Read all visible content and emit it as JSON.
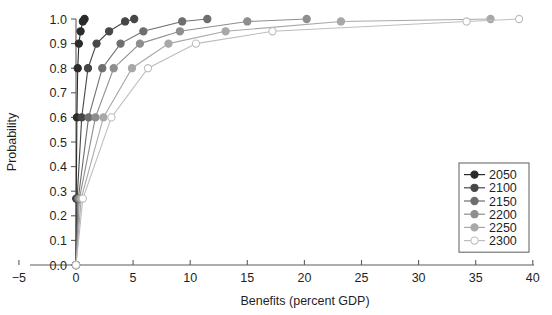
{
  "chart_data": {
    "type": "line",
    "title": "",
    "xlabel": "Benefits (percent GDP)",
    "ylabel": "Probability",
    "xlim": [
      -5,
      40
    ],
    "ylim": [
      0.0,
      1.0
    ],
    "xticks": [
      "-5",
      "0",
      "5",
      "10",
      "15",
      "20",
      "25",
      "30",
      "35",
      "40"
    ],
    "xtick_values": [
      -5,
      0,
      5,
      10,
      15,
      20,
      25,
      30,
      35,
      40
    ],
    "yticks": [
      "0.0",
      "0.1",
      "0.2",
      "0.3",
      "0.4",
      "0.5",
      "0.6",
      "0.7",
      "0.8",
      "0.9",
      "1.0"
    ],
    "ytick_values": [
      0.0,
      0.1,
      0.2,
      0.3,
      0.4,
      0.5,
      0.6,
      0.7,
      0.8,
      0.9,
      1.0
    ],
    "grid": false,
    "legend_position": "right-lower",
    "marker": "circle",
    "probability_levels": [
      0.0,
      0.27,
      0.6,
      0.8,
      0.9,
      0.95,
      0.99,
      1.0
    ],
    "series": [
      {
        "name": "2050",
        "color": "#2b2b2b",
        "marker_fill": "#2b2b2b",
        "x": [
          0.0,
          0.02,
          0.08,
          0.15,
          0.25,
          0.4,
          0.6,
          0.75
        ],
        "y": [
          0.0,
          0.27,
          0.6,
          0.8,
          0.9,
          0.95,
          0.99,
          1.0
        ]
      },
      {
        "name": "2100",
        "color": "#474747",
        "marker_fill": "#474747",
        "x": [
          0.0,
          0.1,
          0.5,
          1.05,
          1.8,
          2.9,
          4.3,
          5.1
        ],
        "y": [
          0.0,
          0.27,
          0.6,
          0.8,
          0.9,
          0.95,
          0.99,
          1.0
        ]
      },
      {
        "name": "2150",
        "color": "#6e6e6e",
        "marker_fill": "#6e6e6e",
        "x": [
          0.0,
          0.2,
          1.1,
          2.3,
          3.9,
          5.9,
          9.3,
          11.5
        ],
        "y": [
          0.0,
          0.27,
          0.6,
          0.8,
          0.9,
          0.95,
          0.99,
          1.0
        ]
      },
      {
        "name": "2200",
        "color": "#8e8e8e",
        "marker_fill": "#8e8e8e",
        "x": [
          0.0,
          0.3,
          1.7,
          3.3,
          5.6,
          9.1,
          15.0,
          20.2
        ],
        "y": [
          0.0,
          0.27,
          0.6,
          0.8,
          0.9,
          0.95,
          0.99,
          1.0
        ]
      },
      {
        "name": "2250",
        "color": "#a8a8a8",
        "marker_fill": "#a8a8a8",
        "x": [
          0.0,
          0.45,
          2.4,
          4.9,
          8.1,
          13.1,
          23.2,
          36.3
        ],
        "y": [
          0.0,
          0.27,
          0.6,
          0.8,
          0.9,
          0.95,
          0.99,
          1.0
        ]
      },
      {
        "name": "2300",
        "color": "#bdbdbd",
        "marker_fill": "#ffffff",
        "x": [
          0.0,
          0.6,
          3.1,
          6.3,
          10.5,
          17.2,
          34.2,
          38.8
        ],
        "y": [
          0.0,
          0.27,
          0.6,
          0.8,
          0.9,
          0.95,
          0.99,
          1.0
        ]
      }
    ]
  },
  "legend": {
    "items": [
      {
        "label": "2050"
      },
      {
        "label": "2100"
      },
      {
        "label": "2150"
      },
      {
        "label": "2200"
      },
      {
        "label": "2250"
      },
      {
        "label": "2300"
      }
    ]
  },
  "caption": {
    "text": ""
  }
}
